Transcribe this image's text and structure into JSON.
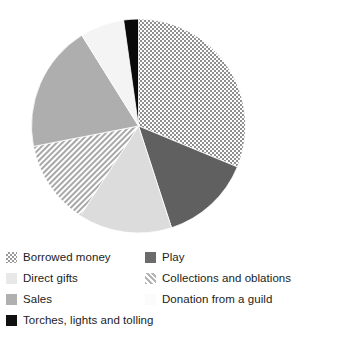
{
  "chart_data": {
    "type": "pie",
    "title": "",
    "subtitle": "",
    "xlabel": "",
    "ylabel": "",
    "grid": false,
    "legend_position": "bottom",
    "legend_columns": 2,
    "start_angle_deg": 0,
    "direction": "clockwise",
    "center": {
      "x": 138.5,
      "y": 126
    },
    "radius": 107,
    "categories": [
      "Borrowed money",
      "Play",
      "Sales",
      "Collections and oblations",
      "Direct gifts",
      "Donation from a guild",
      "Torches, lights and tolling"
    ],
    "values": [
      31.2,
      13.8,
      14.2,
      12.8,
      19.2,
      6.6,
      2.2
    ],
    "units": "percent",
    "slices": [
      {
        "label": "Borrowed money",
        "value": 31.2,
        "start_angle": 0,
        "end_angle": 112.5,
        "fill": "checkerboard",
        "color": "#9a9a9a"
      },
      {
        "label": "Play",
        "value": 13.8,
        "start_angle": 112.5,
        "end_angle": 162.0,
        "fill": "solid",
        "color": "#606060"
      },
      {
        "label": "Sales",
        "value": 14.2,
        "start_angle": 162.0,
        "end_angle": 213.0,
        "fill": "solid",
        "color": "#dcdcdc"
      },
      {
        "label": "Collections and oblations",
        "value": 12.8,
        "start_angle": 213.0,
        "end_angle": 259.0,
        "fill": "diagonal-hatch",
        "color": "#b5b5b5"
      },
      {
        "label": "Direct gifts",
        "value": 19.2,
        "start_angle": 259.0,
        "end_angle": 328.0,
        "fill": "solid",
        "color": "#aeaeae"
      },
      {
        "label": "Donation from a guild",
        "value": 6.6,
        "start_angle": 328.0,
        "end_angle": 352.0,
        "fill": "solid",
        "color": "#f4f4f4"
      },
      {
        "label": "Torches, lights and tolling",
        "value": 2.2,
        "start_angle": 352.0,
        "end_angle": 360.0,
        "fill": "solid",
        "color": "#0a0a0a"
      }
    ]
  },
  "legend": {
    "left_column": [
      {
        "label": "Borrowed money",
        "swatch": "checkerboard",
        "color": "#9a9a9a"
      },
      {
        "label": "Direct gifts",
        "swatch": "solid",
        "color": "#e8e8e8"
      },
      {
        "label": "Sales",
        "swatch": "solid",
        "color": "#b0b0b0"
      },
      {
        "label": "Torches, lights and tolling",
        "swatch": "solid",
        "color": "#101010"
      }
    ],
    "right_column": [
      {
        "label": "Play",
        "swatch": "solid",
        "color": "#6b6b6b"
      },
      {
        "label": "Collections and oblations",
        "swatch": "diagonal-hatch",
        "color": "#b5b5b5"
      },
      {
        "label": "Donation from a guild",
        "swatch": "solid",
        "color": "#fbfbfb"
      }
    ]
  }
}
